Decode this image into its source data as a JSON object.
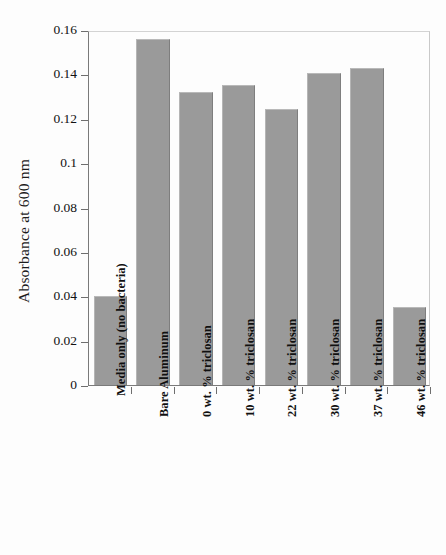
{
  "chart_data": {
    "type": "bar",
    "title": "",
    "subtitle": "",
    "xlabel": "",
    "ylabel": "Absorbance at 600 nm",
    "ylim": [
      0,
      0.16
    ],
    "ytick_labels": [
      "0",
      "0.02",
      "0.04",
      "0.06",
      "0.08",
      "0.1",
      "0.12",
      "0.14",
      "0.16"
    ],
    "ytick_values": [
      0,
      0.02,
      0.04,
      0.06,
      0.08,
      0.1,
      0.12,
      0.14,
      0.16
    ],
    "grid": false,
    "legend": "none",
    "bar_color": "#9a9a9a",
    "categories": [
      "Media only (no bacteria)",
      "Bare Aluminum",
      "0 wt. % triclosan",
      "10 wt. % triclosan",
      "22 wt. % triclosan",
      "30 wt. % triclosan",
      "37 wt. % triclosan",
      "46 wt. % triclosan"
    ],
    "values": [
      0.04,
      0.156,
      0.132,
      0.135,
      0.1245,
      0.1408,
      0.143,
      0.0353
    ]
  }
}
